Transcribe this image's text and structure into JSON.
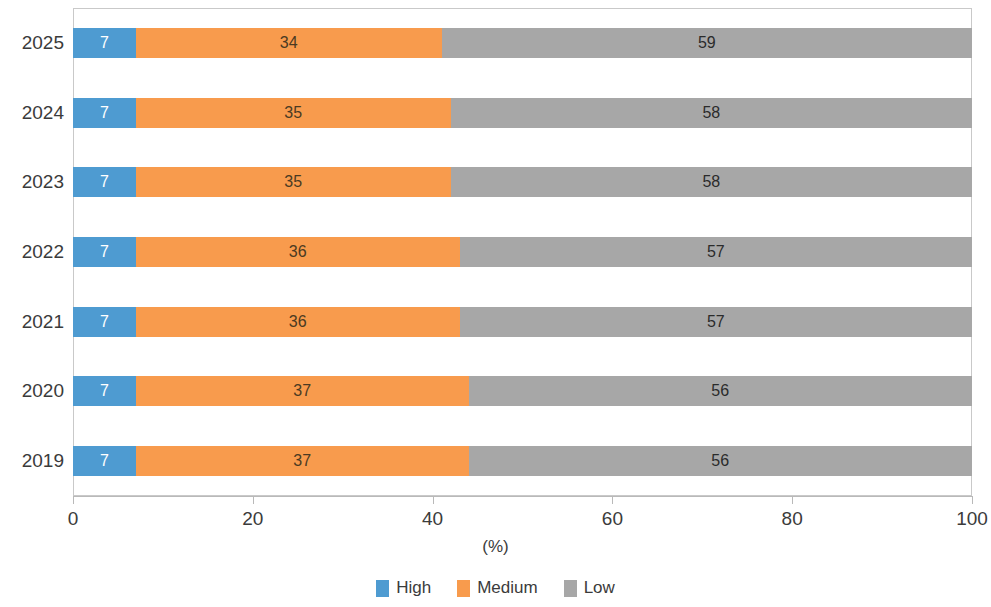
{
  "chart_data": {
    "type": "bar",
    "orientation": "horizontal",
    "stacked": true,
    "stacked_mode": "percent",
    "title": "",
    "subtitle": "",
    "xlabel": "(%)",
    "ylabel": "",
    "xlim": [
      0,
      100
    ],
    "xticks": [
      0,
      20,
      40,
      60,
      80,
      100
    ],
    "xticklabels": [
      "0",
      "20",
      "40",
      "60",
      "80",
      "100"
    ],
    "grid": false,
    "legend_position": "bottom",
    "categories": [
      "2025",
      "2024",
      "2023",
      "2022",
      "2021",
      "2020",
      "2019"
    ],
    "series": [
      {
        "name": "High",
        "color": "#4E9BD1",
        "label_color": "#ffffff",
        "values": [
          7,
          7,
          7,
          7,
          7,
          7,
          7
        ],
        "labels": [
          "7",
          "7",
          "7",
          "7",
          "7",
          "7",
          "7"
        ]
      },
      {
        "name": "Medium",
        "color": "#F89B4D",
        "label_color": "#4a3a22",
        "values": [
          34,
          35,
          35,
          36,
          36,
          37,
          37
        ],
        "labels": [
          "34",
          "35",
          "35",
          "36",
          "36",
          "37",
          "37"
        ]
      },
      {
        "name": "Low",
        "color": "#A7A7A7",
        "label_color": "#2b2b2b",
        "values": [
          59,
          58,
          58,
          57,
          57,
          56,
          56
        ],
        "labels": [
          "59",
          "58",
          "58",
          "57",
          "57",
          "56",
          "56"
        ]
      }
    ]
  },
  "legend": {
    "items": [
      {
        "label": "High",
        "swatch_class": "sw-high"
      },
      {
        "label": "Medium",
        "swatch_class": "sw-medium"
      },
      {
        "label": "Low",
        "swatch_class": "sw-low"
      }
    ]
  },
  "axis": {
    "x_title": "(%)"
  }
}
